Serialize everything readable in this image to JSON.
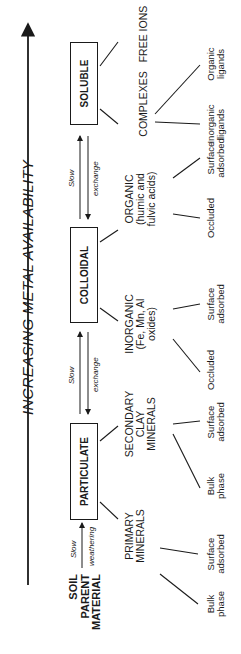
{
  "title": "INCREASING METAL AVAILABILITY",
  "source": {
    "label": "SOIL\nPARENT\nMATERIAL"
  },
  "transitions": {
    "weathering": {
      "top": "Slow",
      "bottom": "weathering"
    },
    "particulate_colloidal": {
      "top": "Slow",
      "bottom": "exchange"
    },
    "colloidal_soluble": {
      "top": "Slow",
      "bottom": "exchange"
    }
  },
  "phases": [
    {
      "label": "PARTICULATE",
      "categories": [
        {
          "label": "PRIMARY\nMINERALS",
          "children": [
            "Bulk\nphase",
            "Surface\nadsorbed"
          ]
        },
        {
          "label": "SECONDARY\nCLAY\nMINERALS",
          "children": [
            "Bulk\nphase",
            "Surface\nadsorbed"
          ]
        }
      ]
    },
    {
      "label": "COLLOIDAL",
      "categories": [
        {
          "label": "INORGANIC\n(Fe, Mn, Al\noxides)",
          "children": [
            "Occluded",
            "Surface\nadsorbed"
          ]
        },
        {
          "label": "ORGANIC\n(humic and\nfulvic acids)",
          "children": [
            "Occluded",
            "Surface\nadsorbed"
          ]
        }
      ]
    },
    {
      "label": "SOLUBLE",
      "categories": [
        {
          "label": "COMPLEXES",
          "children": [
            "Inorganic\nligands",
            "Organic\nligands"
          ]
        },
        {
          "label": "FREE IONS",
          "children": []
        }
      ]
    }
  ]
}
